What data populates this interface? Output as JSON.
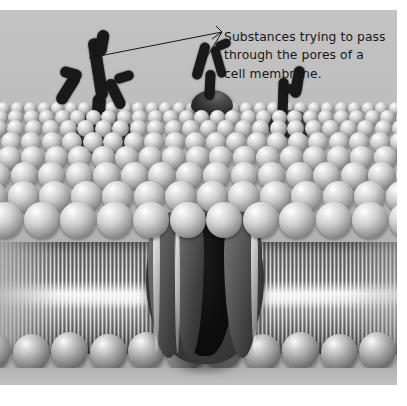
{
  "figure": {
    "background_color": "#ffffff",
    "plate_color": "#b9b9b9",
    "ink_color": "#17171a"
  },
  "annotation": {
    "full_text": "Substances trying to pass through the pores of a cell membrane.",
    "lines": [
      "Substances trying to pass",
      "through the pores of a",
      "cell membrane."
    ],
    "leader_lines": 2
  },
  "structures": {
    "membrane_label": "phospholipid bilayer",
    "pore_label": "membrane pore protein",
    "substance_label": "substance molecule"
  },
  "substances": [
    {
      "name": "substance-left",
      "x": 52,
      "y": 18
    },
    {
      "name": "substance-middle",
      "x": 183,
      "y": 38
    },
    {
      "name": "substance-right",
      "x": 266,
      "y": 62
    }
  ],
  "chart_data": {
    "type": "diagram",
    "title": "Substances trying to pass through the pores of a cell membrane.",
    "elements": [
      {
        "id": "upper-head-layer",
        "kind": "sphere-field",
        "rows": 8,
        "description": "phospholipid head groups, top leaflet"
      },
      {
        "id": "tail-layer",
        "kind": "striation-band",
        "description": "hydrophobic fatty acid tails"
      },
      {
        "id": "lower-head-layer",
        "kind": "sphere-row",
        "count": 11,
        "description": "phospholipid head groups, bottom leaflet"
      },
      {
        "id": "pore",
        "kind": "protein-channel",
        "subunits": 3,
        "description": "transmembrane pore"
      },
      {
        "id": "substance-left",
        "kind": "branched-molecule",
        "branches": 4
      },
      {
        "id": "substance-middle",
        "kind": "branched-molecule",
        "branches": 3
      },
      {
        "id": "substance-right",
        "kind": "branched-molecule",
        "branches": 2
      }
    ]
  }
}
